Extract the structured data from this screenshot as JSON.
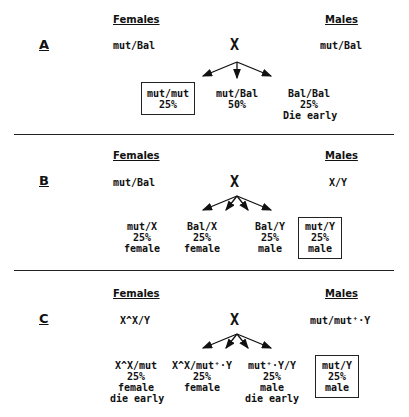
{
  "panels": [
    {
      "label": "A",
      "females_header": "Females",
      "males_header": "Males",
      "female_genotype": "mut/Bal",
      "cross_symbol": "X",
      "male_genotype": "mut/Bal",
      "offspring": [
        {
          "genotype": "mut/mut",
          "percent": "25%",
          "boxed": true
        },
        {
          "genotype": "mut/Bal",
          "percent": "50%"
        },
        {
          "genotype": "Bal/Bal",
          "percent": "25%",
          "note": "Die early"
        }
      ]
    },
    {
      "label": "B",
      "females_header": "Females",
      "males_header": "Males",
      "female_genotype": "mut/Bal",
      "cross_symbol": "X",
      "male_genotype": "X/Y",
      "offspring": [
        {
          "genotype": "mut/X",
          "percent": "25%",
          "sex": "female"
        },
        {
          "genotype": "Bal/X",
          "percent": "25%",
          "sex": "female"
        },
        {
          "genotype": "Bal/Y",
          "percent": "25%",
          "sex": "male"
        },
        {
          "genotype": "mut/Y",
          "percent": "25%",
          "sex": "male",
          "boxed": true
        }
      ]
    },
    {
      "label": "C",
      "females_header": "Females",
      "males_header": "Males",
      "female_genotype": "X^X/Y",
      "cross_symbol": "X",
      "male_genotype": "mut/mut⁺·Y",
      "offspring": [
        {
          "genotype": "X^X/mut",
          "percent": "25%",
          "sex": "female",
          "note": "die early"
        },
        {
          "genotype": "X^X/mut⁺·Y",
          "percent": "25%",
          "sex": "female"
        },
        {
          "genotype": "mut⁺·Y/Y",
          "percent": "25%",
          "sex": "male",
          "note": "die early"
        },
        {
          "genotype": "mut/Y",
          "percent": "25%",
          "sex": "male",
          "boxed": true
        }
      ]
    }
  ]
}
